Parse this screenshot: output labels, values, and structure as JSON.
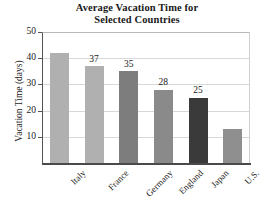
{
  "chart_data": {
    "type": "bar",
    "title": "Average Vacation Time for Selected Countries",
    "title_line1": "Average Vacation Time for",
    "title_line2": "Selected Countries",
    "xlabel": "",
    "ylabel": "Vacation Time (days)",
    "ylim": [
      0,
      50
    ],
    "yticks": [
      10,
      20,
      30,
      40,
      50
    ],
    "grid": true,
    "legend": "none",
    "categories": [
      "Italy",
      "France",
      "Germany",
      "England",
      "Japan",
      "U.S."
    ],
    "values": [
      42,
      37,
      35,
      28,
      25,
      13
    ],
    "data_labels": [
      "",
      "37",
      "35",
      "28",
      "25",
      ""
    ],
    "bar_colors": [
      "#b0b0b0",
      "#b0b0b0",
      "#7d7d7d",
      "#8a8a8a",
      "#3a3a3a",
      "#8f8f8f"
    ],
    "axis_color": "#4a4a4a",
    "grid_color": "#d8d8d8",
    "background": "#ffffff"
  }
}
